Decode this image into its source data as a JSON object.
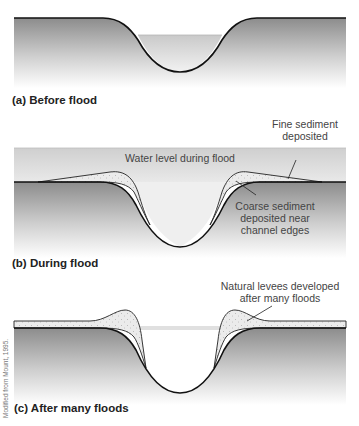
{
  "panels": [
    {
      "id": "a",
      "caption": "(a) Before flood"
    },
    {
      "id": "b",
      "caption": "(b) During flood"
    },
    {
      "id": "c",
      "caption": "(c) After many floods"
    }
  ],
  "labels": {
    "fine_sediment_line1": "Fine sediment",
    "fine_sediment_line2": "deposited",
    "water_level": "Water level during flood",
    "coarse_line1": "Coarse sediment",
    "coarse_line2": "deposited near",
    "coarse_line3": "channel edges",
    "levees_line1": "Natural levees developed",
    "levees_line2": "after many floods"
  },
  "credit": "Modified from Mount, 1995.",
  "colors": {
    "ground_top": "#8a8a8a",
    "water": "#d4d4d4",
    "sediment": "#e6e6e6",
    "outline": "#111111"
  }
}
